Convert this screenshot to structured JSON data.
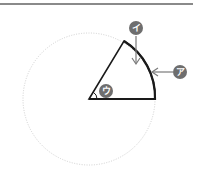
{
  "diagram": {
    "labels": {
      "arc": "ア",
      "arc_top": "イ",
      "central_angle": "ウ"
    },
    "colors": {
      "top_rule": "#8a8a8a",
      "circle_dotted": "#d0d0d0",
      "sector_stroke": "#1a1a1a",
      "label_bg": "#6e6e6e",
      "arrow": "#7a7a7a"
    }
  }
}
